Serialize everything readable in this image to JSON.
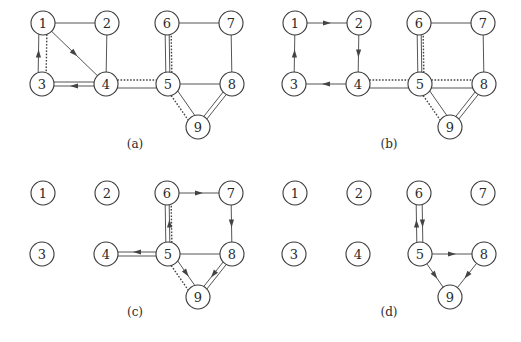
{
  "figure": {
    "width": 521,
    "height": 342,
    "node_radius": 12,
    "colors": {
      "stroke": "#3a3a3a",
      "edge": "#555555",
      "text": "#2a2a2a",
      "background": "#ffffff"
    },
    "base_positions": {
      "1": [
        43,
        23
      ],
      "2": [
        107,
        23
      ],
      "3": [
        42,
        84
      ],
      "4": [
        106,
        84
      ],
      "5": [
        168,
        84
      ],
      "6": [
        167,
        23
      ],
      "7": [
        231,
        23
      ],
      "8": [
        232,
        84
      ],
      "9": [
        198,
        127
      ]
    },
    "panels": [
      {
        "id": "a",
        "label": "(a)",
        "offset": [
          0,
          0
        ],
        "label_pos": [
          135,
          144
        ],
        "nodes": [
          "1",
          "2",
          "3",
          "4",
          "5",
          "6",
          "7",
          "8",
          "9"
        ],
        "edges": [
          {
            "from": "1",
            "to": "2",
            "style": "plain"
          },
          {
            "from": "2",
            "to": "4",
            "style": "plain"
          },
          {
            "from": "1",
            "to": "4",
            "style": "plain",
            "arrow": "forward"
          },
          {
            "from": "3",
            "to": "1",
            "style": "plain",
            "arrow": "forward",
            "shift": -4
          },
          {
            "from": "1",
            "to": "3",
            "style": "dotted",
            "shift": -4
          },
          {
            "from": "3",
            "to": "4",
            "style": "double-arrow",
            "arrow": "backward"
          },
          {
            "from": "4",
            "to": "5",
            "style": "plain",
            "shift": 4
          },
          {
            "from": "4",
            "to": "5",
            "style": "dotted",
            "shift": -4
          },
          {
            "from": "5",
            "to": "6",
            "style": "double"
          },
          {
            "from": "5",
            "to": "6",
            "style": "dotted",
            "shift": 4
          },
          {
            "from": "6",
            "to": "7",
            "style": "plain"
          },
          {
            "from": "7",
            "to": "8",
            "style": "plain"
          },
          {
            "from": "5",
            "to": "8",
            "style": "plain"
          },
          {
            "from": "5",
            "to": "9",
            "style": "plain",
            "shift": -4
          },
          {
            "from": "5",
            "to": "9",
            "style": "dotted",
            "shift": 4
          },
          {
            "from": "8",
            "to": "9",
            "style": "double"
          }
        ]
      },
      {
        "id": "b",
        "label": "(b)",
        "offset": [
          252,
          0
        ],
        "label_pos": [
          389,
          144
        ],
        "nodes": [
          "1",
          "2",
          "3",
          "4",
          "5",
          "6",
          "7",
          "8",
          "9"
        ],
        "edges": [
          {
            "from": "1",
            "to": "2",
            "style": "plain",
            "arrow": "forward"
          },
          {
            "from": "2",
            "to": "4",
            "style": "plain",
            "arrow": "forward"
          },
          {
            "from": "4",
            "to": "3",
            "style": "plain",
            "arrow": "forward"
          },
          {
            "from": "3",
            "to": "1",
            "style": "plain",
            "arrow": "forward"
          },
          {
            "from": "4",
            "to": "5",
            "style": "plain",
            "shift": 4
          },
          {
            "from": "4",
            "to": "5",
            "style": "dotted",
            "shift": -4
          },
          {
            "from": "5",
            "to": "6",
            "style": "double"
          },
          {
            "from": "5",
            "to": "6",
            "style": "dotted",
            "shift": 4
          },
          {
            "from": "6",
            "to": "7",
            "style": "plain"
          },
          {
            "from": "7",
            "to": "8",
            "style": "plain"
          },
          {
            "from": "5",
            "to": "8",
            "style": "plain",
            "shift": 4
          },
          {
            "from": "5",
            "to": "8",
            "style": "dotted",
            "shift": -4
          },
          {
            "from": "5",
            "to": "9",
            "style": "plain",
            "shift": -4
          },
          {
            "from": "5",
            "to": "9",
            "style": "dotted",
            "shift": 4
          },
          {
            "from": "8",
            "to": "9",
            "style": "double"
          }
        ]
      },
      {
        "id": "c",
        "label": "(c)",
        "offset": [
          0,
          170
        ],
        "label_pos": [
          135,
          312
        ],
        "nodes": [
          "1",
          "2",
          "3",
          "4",
          "5",
          "6",
          "7",
          "8",
          "9"
        ],
        "edges": [
          {
            "from": "6",
            "to": "7",
            "style": "plain",
            "arrow": "forward"
          },
          {
            "from": "7",
            "to": "8",
            "style": "plain",
            "arrow": "forward"
          },
          {
            "from": "5",
            "to": "6",
            "style": "double-arrow",
            "arrow": "forward"
          },
          {
            "from": "5",
            "to": "6",
            "style": "dotted",
            "shift": 4
          },
          {
            "from": "5",
            "to": "4",
            "style": "double-arrow",
            "arrow": "forward"
          },
          {
            "from": "5",
            "to": "8",
            "style": "plain"
          },
          {
            "from": "5",
            "to": "9",
            "style": "plain",
            "arrow": "forward",
            "shift": -4
          },
          {
            "from": "5",
            "to": "9",
            "style": "dotted",
            "shift": 4
          },
          {
            "from": "8",
            "to": "9",
            "style": "double-arrow",
            "arrow": "forward"
          }
        ]
      },
      {
        "id": "d",
        "label": "(d)",
        "offset": [
          252,
          170
        ],
        "label_pos": [
          389,
          312
        ],
        "nodes": [
          "1",
          "2",
          "3",
          "4",
          "5",
          "6",
          "7",
          "8",
          "9"
        ],
        "edges": [
          {
            "from": "5",
            "to": "6",
            "style": "plain",
            "arrow": "forward",
            "shift": -3
          },
          {
            "from": "6",
            "to": "5",
            "style": "plain",
            "arrow": "forward",
            "shift": -3
          },
          {
            "from": "5",
            "to": "8",
            "style": "plain",
            "arrow": "forward"
          },
          {
            "from": "5",
            "to": "9",
            "style": "plain",
            "arrow": "forward"
          },
          {
            "from": "8",
            "to": "9",
            "style": "plain",
            "arrow": "forward"
          }
        ]
      }
    ]
  }
}
